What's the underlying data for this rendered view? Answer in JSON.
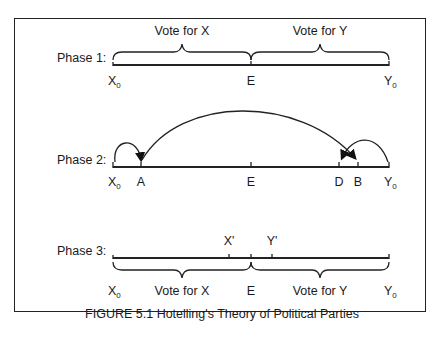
{
  "figure": {
    "caption": "FIGURE 5.1 Hotelling's Theory of Political Parties",
    "phases": [
      {
        "label": "Phase 1:",
        "points": [
          {
            "label": "X",
            "sub": "0"
          },
          {
            "label": "E"
          },
          {
            "label": "Y",
            "sub": "0"
          }
        ],
        "braces": [
          "Vote for X",
          "Vote for Y"
        ]
      },
      {
        "label": "Phase 2:",
        "points": [
          {
            "label": "X",
            "sub": "0"
          },
          {
            "label": "A"
          },
          {
            "label": "E"
          },
          {
            "label": "D"
          },
          {
            "label": "B"
          },
          {
            "label": "Y",
            "sub": "0"
          }
        ]
      },
      {
        "label": "Phase 3:",
        "points": [
          {
            "label": "X'"
          },
          {
            "label": "Y'"
          },
          {
            "label": "X",
            "sub": "0"
          },
          {
            "label": "E"
          },
          {
            "label": "Y",
            "sub": "0"
          }
        ],
        "braces": [
          "Vote for X",
          "Vote for Y"
        ]
      }
    ]
  },
  "colors": {
    "stroke": "#222222",
    "text": "#1a1a1a",
    "background": "#ffffff"
  }
}
